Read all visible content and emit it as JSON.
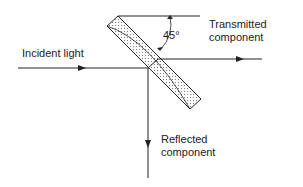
{
  "diagram": {
    "labels": {
      "incident": "Incident light",
      "transmitted_line1": "Transmitted",
      "transmitted_line2": "component",
      "reflected_line1": "Reflected",
      "reflected_line2": "component",
      "angle": "45°"
    },
    "colors": {
      "line": "#222222",
      "dots": "#555555"
    }
  }
}
